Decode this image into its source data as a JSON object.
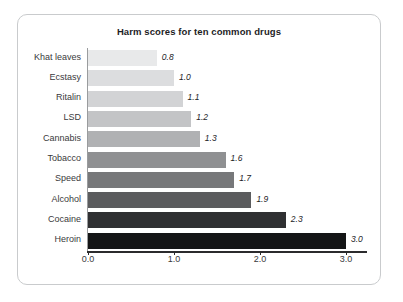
{
  "card": {
    "title": "Harm scores for ten common drugs"
  },
  "chart_data": {
    "type": "bar",
    "orientation": "horizontal",
    "title": "Harm scores for ten common drugs",
    "xlabel": "",
    "ylabel": "",
    "xlim": [
      0.0,
      3.0
    ],
    "grid": false,
    "legend": null,
    "xticks": [
      "0.0",
      "1.0",
      "2.0",
      "3.0"
    ],
    "xtick_values": [
      0.0,
      1.0,
      2.0,
      3.0
    ],
    "categories": [
      "Khat leaves",
      "Ecstasy",
      "Ritalin",
      "LSD",
      "Cannabis",
      "Tobacco",
      "Speed",
      "Alcohol",
      "Cocaine",
      "Heroin"
    ],
    "values": [
      0.8,
      1.0,
      1.1,
      1.2,
      1.3,
      1.6,
      1.7,
      1.9,
      2.3,
      3.0
    ],
    "value_labels": [
      "0.8",
      "1.0",
      "1.1",
      "1.2",
      "1.3",
      "1.6",
      "1.7",
      "1.9",
      "2.3",
      "3.0"
    ],
    "bar_colors": [
      "#e8e9ea",
      "#dcdddf",
      "#d2d3d5",
      "#c3c4c6",
      "#b0b1b3",
      "#8f9092",
      "#77787a",
      "#5b5c5e",
      "#2f3032",
      "#141516"
    ]
  },
  "colors": {
    "card_border": "#c9cbcd",
    "axis": "#2b2b2d",
    "text": "#3a3a3c",
    "title": "#1d1d1f"
  }
}
